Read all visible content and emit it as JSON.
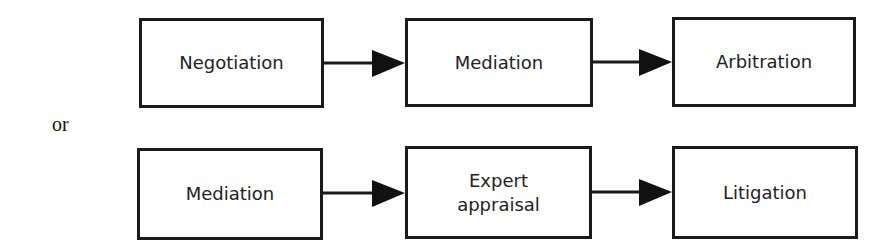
{
  "diagram": {
    "connector_label": "or",
    "rows": [
      {
        "nodes": [
          {
            "label": "Negotiation"
          },
          {
            "label": "Mediation"
          },
          {
            "label": "Arbitration"
          }
        ]
      },
      {
        "nodes": [
          {
            "label": "Mediation"
          },
          {
            "label": "Expert\nappraisal",
            "line1": "Expert",
            "line2": "appraisal"
          },
          {
            "label": "Litigation"
          }
        ]
      }
    ],
    "edges": [
      {
        "from": "Negotiation",
        "to": "Mediation",
        "row": 0
      },
      {
        "from": "Mediation",
        "to": "Arbitration",
        "row": 0
      },
      {
        "from": "Mediation",
        "to": "Expert appraisal",
        "row": 1
      },
      {
        "from": "Expert appraisal",
        "to": "Litigation",
        "row": 1
      }
    ],
    "colors": {
      "stroke": "#1a1a1a",
      "text": "#222222",
      "background": "#ffffff"
    }
  }
}
